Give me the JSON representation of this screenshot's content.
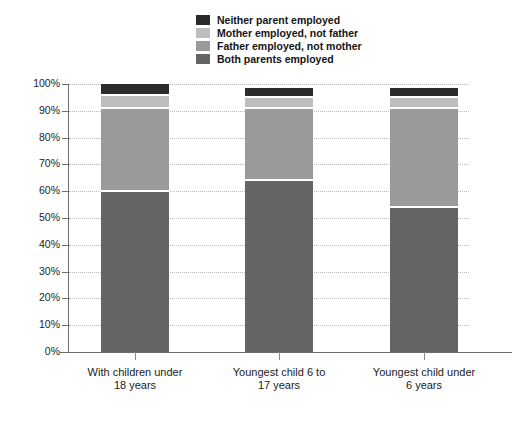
{
  "chart_data": {
    "type": "bar",
    "title": "",
    "subtitle": "",
    "xlabel": "",
    "ylabel": "",
    "ylim": [
      0,
      100
    ],
    "ytick_labels": [
      "100%",
      "90%",
      "80%",
      "70%",
      "60%",
      "50%",
      "40%",
      "30%",
      "20%",
      "10%",
      "0%"
    ],
    "ytick_values": [
      100,
      90,
      80,
      70,
      60,
      50,
      40,
      30,
      20,
      10,
      0
    ],
    "grid": true,
    "stacked": true,
    "legend_position": "top-center",
    "categories": [
      "With children under 18 years",
      "Youngest child 6 to 17 years",
      "Youngest child under 6 years"
    ],
    "category_lines": [
      [
        "With children under",
        "18 years"
      ],
      [
        "Youngest child 6 to",
        "17 years"
      ],
      [
        "Youngest child under",
        "6 years"
      ]
    ],
    "series": [
      {
        "name": "Both parents employed",
        "color": "#656565",
        "values": [
          60,
          64,
          54
        ]
      },
      {
        "name": "Father employed, not mother",
        "color": "#9a9a9a",
        "values": [
          31,
          27,
          37
        ]
      },
      {
        "name": "Mother employed, not father",
        "color": "#bdbdbd",
        "values": [
          5,
          4,
          4
        ]
      },
      {
        "name": "Neither parent employed",
        "color": "#2b2b2b",
        "values": [
          4,
          3.5,
          3.5
        ]
      }
    ],
    "series_order_top_to_bottom": [
      "Neither parent employed",
      "Mother employed, not father",
      "Father employed, not mother",
      "Both parents employed"
    ]
  },
  "legend": {
    "items": [
      {
        "label": "Neither parent employed",
        "color": "#2b2b2b"
      },
      {
        "label": "Mother employed, not father",
        "color": "#bdbdbd"
      },
      {
        "label": "Father employed, not mother",
        "color": "#9a9a9a"
      },
      {
        "label": "Both parents employed",
        "color": "#656565"
      }
    ]
  },
  "footer": {
    "note": ""
  }
}
